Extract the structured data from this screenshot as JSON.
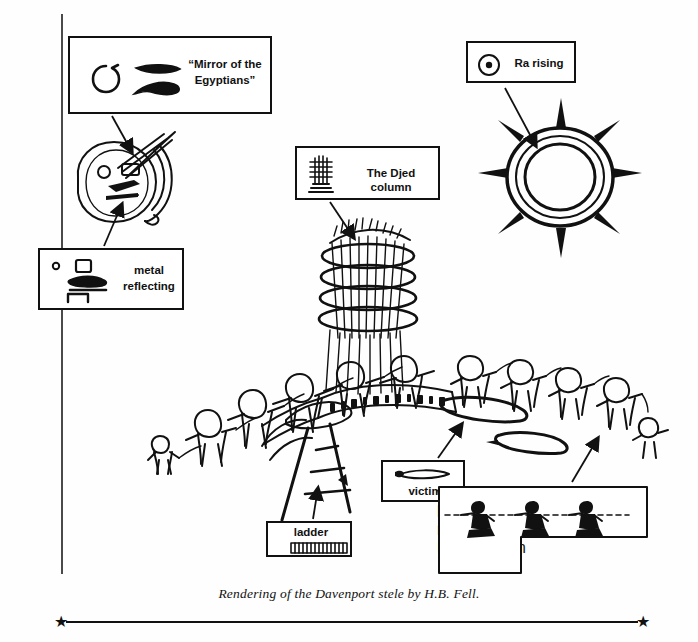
{
  "figure": {
    "caption": "Rendering of the Davenport stele by H.B. Fell.",
    "star_glyph": "★"
  },
  "callouts": {
    "mirror": {
      "label": "“Mirror of the\nEgyptians”",
      "line1": "“Mirror of the",
      "line2": "Egyptians”",
      "glyphs": [
        "circle-hook-glyph",
        "lens-oval-glyph",
        "curved-hook-glyph"
      ]
    },
    "metal": {
      "line1": "metal",
      "line2": "reflecting",
      "glyphs": [
        "dot-glyph",
        "square-glyph",
        "reclining-glyph",
        "bracket-glyph"
      ]
    },
    "djed": {
      "label": "The Djed column",
      "glyphs": [
        "djed-pillar-glyph"
      ]
    },
    "ra": {
      "label": "Ra rising",
      "glyphs": [
        "sun-disc-glyph"
      ]
    },
    "victim": {
      "label": "victim",
      "glyphs": [
        "prone-body-glyph"
      ]
    },
    "ladder": {
      "label": "ladder",
      "glyphs": [
        "hatched-ladder-glyph"
      ]
    },
    "worshippers": {
      "line1": "worshippers hauling",
      "line2": "ropes to raise the",
      "line3": "Djed column",
      "glyphs": [
        "hauling-figures-glyph"
      ]
    }
  },
  "artwork": {
    "title": "davenport-stele-rendering",
    "elements": [
      "mirror-disc-drawing",
      "djed-column-drawing",
      "sun-rays-drawing",
      "worshipper-crowd-arc",
      "inscription-band",
      "ladder-drawing",
      "rope-and-victim-drawing"
    ]
  },
  "colors": {
    "ink": "#111111",
    "paper": "#fefefe",
    "frame": "#4a4a4a"
  }
}
